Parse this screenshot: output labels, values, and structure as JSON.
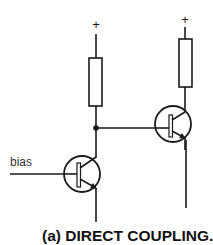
{
  "diagram": {
    "title": "(a) DIRECT COUPLING.",
    "type": "circuit-schematic",
    "labels": {
      "bias": "bias",
      "supply_left": "+",
      "supply_right": "+"
    },
    "components": [
      {
        "id": "R1",
        "kind": "resistor",
        "connects": [
          "+",
          "node-A"
        ]
      },
      {
        "id": "R2",
        "kind": "resistor",
        "connects": [
          "+",
          "Q2-collector"
        ]
      },
      {
        "id": "Q1",
        "kind": "npn-transistor",
        "base": "bias",
        "collector": "node-A",
        "emitter": "ground"
      },
      {
        "id": "Q2",
        "kind": "npn-transistor",
        "base": "node-A",
        "collector": "R2",
        "emitter": "output"
      }
    ],
    "junctions": [
      "node-A"
    ],
    "colors": {
      "ink": "#1a1a1a",
      "background": "#ffffff"
    }
  }
}
